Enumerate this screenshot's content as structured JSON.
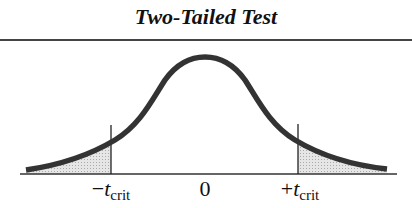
{
  "title": "Two-Tailed Test",
  "diagram": {
    "type": "t-distribution-two-tailed",
    "curve_color": "#333333",
    "shade_color": "#d8d8d8",
    "labels": {
      "left_sign": "−",
      "left_var": "t",
      "left_sub": "crit",
      "center": "0",
      "right_sign": "+",
      "right_var": "t",
      "right_sub": "crit"
    }
  }
}
